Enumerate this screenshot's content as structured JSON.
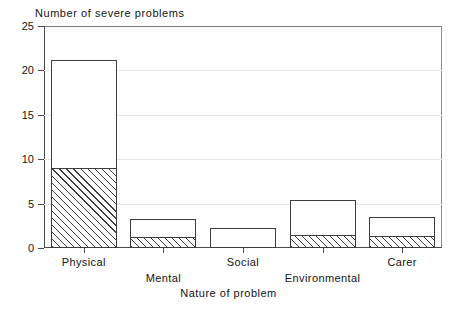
{
  "chart_data": {
    "type": "bar",
    "title": "",
    "ylabel": "Number of severe problems",
    "xlabel": "Nature of problem",
    "categories": [
      "Physical",
      "Mental",
      "Social",
      "Environmental",
      "Carer"
    ],
    "ylim": [
      0,
      25
    ],
    "yticks": [
      0,
      5,
      10,
      15,
      20,
      25
    ],
    "ytick_labels": [
      "0",
      "5",
      "10",
      "15",
      "20",
      "25"
    ],
    "grid": true,
    "legend": "none",
    "series": [
      {
        "name": "hatched",
        "values": [
          9.0,
          1.2,
          0.0,
          1.5,
          1.4
        ]
      },
      {
        "name": "open",
        "values": [
          21.2,
          3.3,
          2.2,
          5.4,
          3.5
        ]
      }
    ],
    "values": [
      21.2,
      3.3,
      2.2,
      5.4,
      3.5
    ],
    "bars": [
      {
        "label": "Physical",
        "total": 21.2,
        "hatched": 9.0,
        "label_row": 0
      },
      {
        "label": "Mental",
        "total": 3.3,
        "hatched": 1.2,
        "label_row": 1
      },
      {
        "label": "Social",
        "total": 2.2,
        "hatched": 0.0,
        "label_row": 0
      },
      {
        "label": "Environmental",
        "total": 5.4,
        "hatched": 1.5,
        "label_row": 1
      },
      {
        "label": "Carer",
        "total": 3.5,
        "hatched": 1.4,
        "label_row": 0
      }
    ],
    "colors": {
      "axis": "#4a4a4a",
      "bar_outline": "#3d3d3d",
      "bar_fill": "#ffffff",
      "hatch": "#3d3d3d",
      "grid": "#e8e8e8",
      "background": "#ffffff",
      "text": "#141414"
    }
  }
}
